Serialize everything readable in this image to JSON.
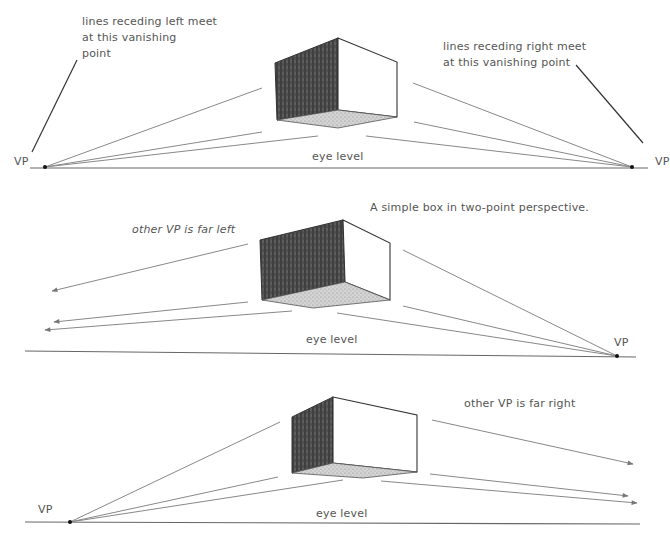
{
  "panels": [
    {
      "id": "two-point",
      "annotation_left": [
        "lines receding left meet",
        "at this vanishing",
        "point"
      ],
      "annotation_right": [
        "lines receding right meet",
        "at this vanishing point"
      ],
      "vp_left_label": "VP",
      "vp_right_label": "VP",
      "eye_level_label": "eye level"
    },
    {
      "id": "far-left",
      "caption": "A simple box in two-point perspective.",
      "note": "other VP is far left",
      "vp_right_label": "VP",
      "eye_level_label": "eye level"
    },
    {
      "id": "far-right",
      "note": "other VP is far right",
      "vp_left_label": "VP",
      "eye_level_label": "eye level"
    }
  ],
  "colors": {
    "line": "#777777",
    "edge": "#333333",
    "dark_face": "#4a4a4a",
    "bottom_face": "#c8c8c8",
    "text": "#555555"
  }
}
